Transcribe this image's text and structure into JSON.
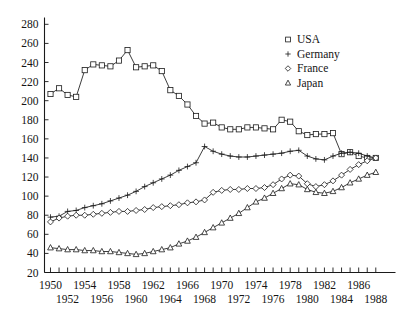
{
  "chart_data": {
    "type": "line",
    "title": "",
    "subtitle": "",
    "xlabel": "",
    "ylabel": "",
    "xlim": [
      1949.3,
      1988.9
    ],
    "ylim": [
      20,
      284
    ],
    "yticks": [
      20,
      40,
      60,
      80,
      100,
      120,
      140,
      160,
      180,
      200,
      220,
      240,
      260,
      280
    ],
    "xticks_top_row": [
      1950,
      1954,
      1958,
      1962,
      1966,
      1970,
      1974,
      1978,
      1982,
      1986
    ],
    "xticks_bottom_row": [
      1952,
      1956,
      1960,
      1964,
      1968,
      1972,
      1976,
      1980,
      1984,
      1988
    ],
    "xtick_all": [
      1950,
      1951,
      1952,
      1953,
      1954,
      1955,
      1956,
      1957,
      1958,
      1959,
      1960,
      1961,
      1962,
      1963,
      1964,
      1965,
      1966,
      1967,
      1968,
      1969,
      1970,
      1971,
      1972,
      1973,
      1974,
      1975,
      1976,
      1977,
      1978,
      1979,
      1980,
      1981,
      1982,
      1983,
      1984,
      1985,
      1986,
      1987,
      1988
    ],
    "grid": false,
    "legend_position": "top-right",
    "x": [
      1950,
      1951,
      1952,
      1953,
      1954,
      1955,
      1956,
      1957,
      1958,
      1959,
      1960,
      1961,
      1962,
      1963,
      1964,
      1965,
      1966,
      1967,
      1968,
      1969,
      1970,
      1971,
      1972,
      1973,
      1974,
      1975,
      1976,
      1977,
      1978,
      1979,
      1980,
      1981,
      1982,
      1983,
      1984,
      1985,
      1986,
      1987,
      1988
    ],
    "series": [
      {
        "name": "USA",
        "marker": "square",
        "values": [
          207,
          213,
          206,
          204,
          232,
          238,
          237,
          236,
          242,
          253,
          235,
          236,
          237,
          231,
          211,
          205,
          196,
          184,
          176,
          177,
          172,
          170,
          170,
          172,
          172,
          171,
          170,
          180,
          178,
          168,
          164,
          165,
          165,
          166,
          144,
          146,
          142,
          140,
          140
        ]
      },
      {
        "name": "Germany",
        "marker": "plus",
        "values": [
          78,
          79,
          84,
          85,
          88,
          90,
          92,
          95,
          98,
          101,
          105,
          110,
          114,
          118,
          122,
          127,
          131,
          135,
          152,
          147,
          144,
          142,
          141,
          141,
          142,
          143,
          144,
          145,
          147,
          148,
          142,
          139,
          138,
          142,
          145,
          146,
          145,
          142,
          140
        ]
      },
      {
        "name": "France",
        "marker": "diamond",
        "values": [
          73,
          77,
          79,
          80,
          80,
          81,
          82,
          83,
          84,
          84,
          85,
          86,
          88,
          89,
          90,
          91,
          93,
          94,
          96,
          104,
          106,
          107,
          107,
          108,
          108,
          109,
          112,
          118,
          122,
          121,
          113,
          110,
          112,
          116,
          122,
          128,
          133,
          137,
          140
        ]
      },
      {
        "name": "Japan",
        "marker": "triangle",
        "values": [
          46,
          45,
          44,
          44,
          43,
          43,
          42,
          42,
          41,
          40,
          39,
          40,
          42,
          44,
          46,
          50,
          53,
          57,
          62,
          67,
          72,
          77,
          82,
          88,
          94,
          98,
          103,
          108,
          113,
          112,
          107,
          104,
          103,
          105,
          109,
          114,
          118,
          122,
          125
        ]
      }
    ]
  },
  "legend": {
    "items": [
      {
        "label": "USA",
        "marker": "square"
      },
      {
        "label": "Germany",
        "marker": "plus"
      },
      {
        "label": "France",
        "marker": "diamond"
      },
      {
        "label": "Japan",
        "marker": "triangle"
      }
    ]
  },
  "colors": {
    "ink": "#1a1a1a",
    "background": "#ffffff"
  }
}
